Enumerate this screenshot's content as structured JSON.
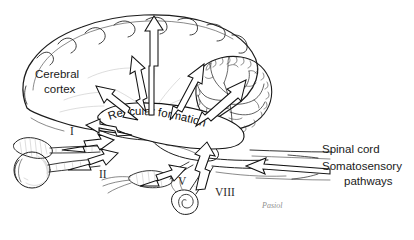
{
  "figure": {
    "background_color": "#ffffff",
    "ink_color": "#1c1c1c",
    "signature": "Pasiol"
  },
  "labels": {
    "cerebral_cortex_line1": "Cerebral",
    "cerebral_cortex_line2": "cortex",
    "reticular_formation": "Reticular formation",
    "spinal_cord": "Spinal cord",
    "somatosensory_line1": "Somatosensory",
    "somatosensory_line2": "pathways"
  },
  "cranial_nerves": [
    {
      "numeral": "I",
      "name": "olfactory"
    },
    {
      "numeral": "II",
      "name": "optic"
    },
    {
      "numeral": "V",
      "name": "trigeminal"
    },
    {
      "numeral": "VIII",
      "name": "vestibulocochlear"
    }
  ],
  "structures": [
    {
      "name": "cerebral-cortex"
    },
    {
      "name": "cerebellum"
    },
    {
      "name": "reticular-formation"
    },
    {
      "name": "brainstem"
    },
    {
      "name": "eye"
    },
    {
      "name": "olfactory-bulb"
    },
    {
      "name": "cochlea"
    },
    {
      "name": "spinal-cord"
    }
  ],
  "arrows": {
    "outgoing_count": 6,
    "incoming_count": 5,
    "outgoing_description": "diffuse projections from reticular formation to cerebral cortex",
    "incoming_description": "sensory input from cranial nerves and somatosensory pathways"
  }
}
